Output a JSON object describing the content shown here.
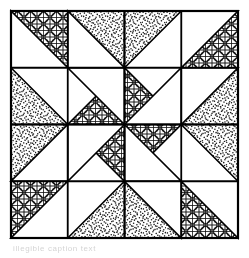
{
  "figure": {
    "kind": "line-art-diagram",
    "caption": "illegible caption text",
    "canvas": {
      "width": 249,
      "height": 258,
      "background": "#ffffff"
    }
  },
  "colors": {
    "ink": "#000000",
    "paper": "#ffffff",
    "stipple": "#1a1a1a",
    "lattice": "#111111",
    "caption_text": "#6f6f6f"
  },
  "block": {
    "origin_x": 11,
    "origin_y": 11,
    "size": 227,
    "grid_cells": 4,
    "cell_size": 56.75,
    "border_width": 2.2,
    "grid_line_width": 1.8,
    "shape_line_width": 1.6
  },
  "fills": {
    "names": [
      "white",
      "stipple",
      "lattice"
    ],
    "white_label": "plain white",
    "stipple_label": "random dot stipple",
    "lattice_label": "overlapping circle lattice"
  },
  "textures": {
    "lattice": {
      "tile": 13,
      "circle_radius": 5.0,
      "stroke_width": 1.05,
      "grid_stroke_width": 0.95
    },
    "stipple": {
      "tile": 24,
      "dot_count": 150,
      "dot_radius": 0.78,
      "seed": 20252
    }
  },
  "geometry": {
    "description": "4x4 grid quilt block with four-fold rotational symmetry; each quadrant holds triangles converging on the block centre forming a pinwheel star.",
    "quadrants": [
      {
        "name": "top-left",
        "rotation": 0
      },
      {
        "name": "top-right",
        "rotation": 90
      },
      {
        "name": "bottom-right",
        "rotation": 180
      },
      {
        "name": "bottom-left",
        "rotation": 270
      }
    ],
    "quadrant_triangles": [
      {
        "id": "corner-lattice",
        "fill": "lattice",
        "points": "0,0 113.5,0 0,113.5"
      },
      {
        "id": "corner-white",
        "fill": "white",
        "points": "0,0 113.5,0 0,113.5"
      },
      {
        "id": "upper-white-wedge",
        "fill": "white",
        "points": "0,0 0,56.75 56.75,56.75"
      },
      {
        "id": "upper-stipple-wedge",
        "fill": "stipple",
        "points": "56.75,0 113.5,0 113.5,56.75"
      },
      {
        "id": "inner-lattice-wedge",
        "fill": "lattice",
        "points": "56.75,56.75 113.5,56.75 113.5,113.5"
      },
      {
        "id": "inner-white-wedge",
        "fill": "white",
        "points": "0,56.75 56.75,113.5 0,113.5"
      },
      {
        "id": "pinwheel-blade",
        "fill": "lattice",
        "points": "113.5,113.5 56.75,113.5 113.5,56.75"
      }
    ]
  },
  "labels": {
    "figure_region": "quilt-block-figure",
    "caption_region": "figure-caption"
  }
}
